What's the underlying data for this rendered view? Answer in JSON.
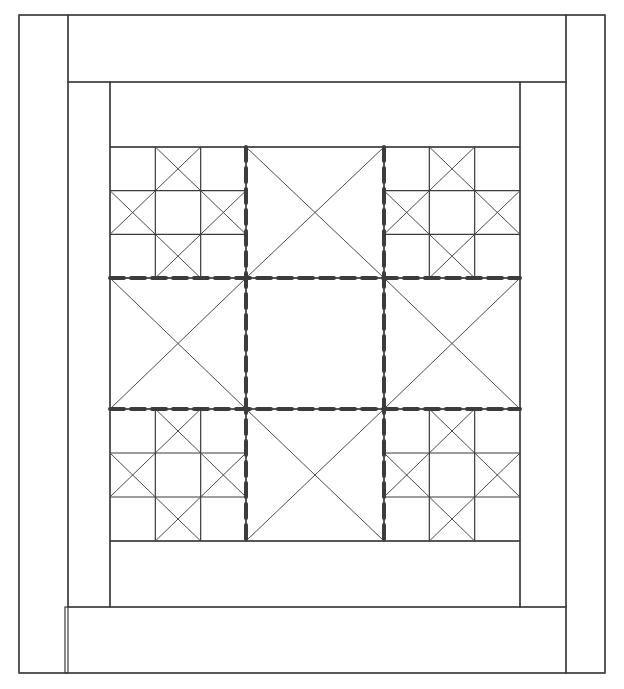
{
  "diagram": {
    "title": "",
    "colors": {
      "background": "#ffffff",
      "line": "#3a3a3a",
      "seam": "#3c3c3c"
    },
    "outer_frame": {
      "x": 19,
      "y": 15,
      "w": 586,
      "h": 658
    },
    "borders": {
      "outer_left": {
        "x": 19,
        "y": 15,
        "w": 49,
        "h": 658
      },
      "outer_top": {
        "x": 68,
        "y": 15,
        "w": 498,
        "h": 67
      },
      "outer_right": {
        "x": 566,
        "y": 15,
        "w": 39,
        "h": 658
      },
      "outer_bottom": {
        "x": 65,
        "y": 607,
        "w": 501,
        "h": 66
      },
      "inner_left": {
        "x": 68,
        "y": 82,
        "w": 42,
        "h": 525
      },
      "inner_top": {
        "x": 110,
        "y": 82,
        "w": 410,
        "h": 65
      },
      "inner_right": {
        "x": 520,
        "y": 82,
        "w": 46,
        "h": 525
      },
      "inner_bottom": {
        "x": 110,
        "y": 541,
        "w": 410,
        "h": 66
      }
    },
    "center_grid": {
      "cols": [
        110,
        246,
        384,
        520
      ],
      "rows": [
        147,
        278,
        409,
        541
      ],
      "blocks": [
        {
          "row": 0,
          "col": 0,
          "type": "nine-patch-star"
        },
        {
          "row": 0,
          "col": 1,
          "type": "hourglass"
        },
        {
          "row": 0,
          "col": 2,
          "type": "nine-patch-star"
        },
        {
          "row": 1,
          "col": 0,
          "type": "hourglass"
        },
        {
          "row": 1,
          "col": 1,
          "type": "plain"
        },
        {
          "row": 1,
          "col": 2,
          "type": "hourglass"
        },
        {
          "row": 2,
          "col": 0,
          "type": "nine-patch-star"
        },
        {
          "row": 2,
          "col": 1,
          "type": "hourglass"
        },
        {
          "row": 2,
          "col": 2,
          "type": "nine-patch-star"
        }
      ],
      "seam_lines": "dashed"
    }
  }
}
